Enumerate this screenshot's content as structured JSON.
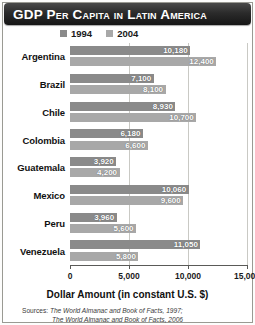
{
  "title": "GDP Per Capita in Latin America",
  "legend": {
    "items": [
      {
        "label": "1994",
        "color": "#8a8a8a"
      },
      {
        "label": "2004",
        "color": "#a8a8a8"
      }
    ]
  },
  "axis": {
    "title": "Dollar Amount (in constant U.S. $)",
    "ticks": [
      "0",
      "5,000",
      "10,000",
      "15,000"
    ]
  },
  "sources": {
    "prefix": "Sources:",
    "line1": "The World Almanac and Book of Facts, 1997;",
    "line2": "The World Almanac and Book of Facts, 2006"
  },
  "chart_data": {
    "type": "bar",
    "orientation": "horizontal",
    "title": "GDP Per Capita in Latin America",
    "xlabel": "Dollar Amount (in constant U.S. $)",
    "ylabel": "",
    "xlim": [
      0,
      15000
    ],
    "xticks": [
      0,
      5000,
      10000,
      15000
    ],
    "grid": true,
    "legend_position": "top",
    "categories": [
      "Argentina",
      "Brazil",
      "Chile",
      "Colombia",
      "Guatemala",
      "Mexico",
      "Peru",
      "Venezuela"
    ],
    "series": [
      {
        "name": "1994",
        "color": "#8a8a8a",
        "values": [
          10180,
          7100,
          8930,
          6180,
          3920,
          10060,
          3960,
          11050
        ],
        "labels": [
          "10,180",
          "7,100",
          "8,930",
          "6,180",
          "3,920",
          "10,060",
          "3,960",
          "11,050"
        ]
      },
      {
        "name": "2004",
        "color": "#a8a8a8",
        "values": [
          12400,
          8100,
          10700,
          6600,
          4200,
          9600,
          5600,
          5800
        ],
        "labels": [
          "12,400",
          "8,100",
          "10,700",
          "6,600",
          "4,200",
          "9,600",
          "5,600",
          "5,800"
        ]
      }
    ]
  }
}
